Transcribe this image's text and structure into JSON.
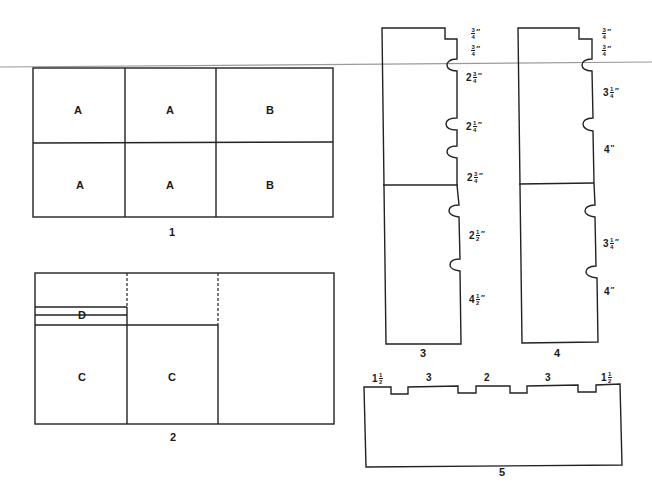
{
  "figure": {
    "diagram1": {
      "caption": "1",
      "cells": [
        {
          "row": 1,
          "col": 1,
          "label": "A"
        },
        {
          "row": 1,
          "col": 2,
          "label": "A"
        },
        {
          "row": 1,
          "col": 3,
          "label": "B"
        },
        {
          "row": 2,
          "col": 1,
          "label": "A"
        },
        {
          "row": 2,
          "col": 2,
          "label": "A"
        },
        {
          "row": 2,
          "col": 3,
          "label": "B"
        }
      ]
    },
    "diagram2": {
      "caption": "2",
      "labels": {
        "d": "D",
        "c1": "C",
        "c2": "C"
      }
    },
    "diagram3": {
      "caption": "3",
      "dimensions": [
        {
          "whole": "",
          "num": "3",
          "den": "4",
          "unit": "″"
        },
        {
          "whole": "",
          "num": "3",
          "den": "4",
          "unit": "″"
        },
        {
          "whole": "2",
          "num": "3",
          "den": "4",
          "unit": "″"
        },
        {
          "whole": "2",
          "num": "1",
          "den": "4",
          "unit": "″"
        },
        {
          "whole": "2",
          "num": "3",
          "den": "4",
          "unit": "″"
        },
        {
          "whole": "2",
          "num": "1",
          "den": "2",
          "unit": "″"
        },
        {
          "whole": "4",
          "num": "1",
          "den": "2",
          "unit": "″"
        }
      ]
    },
    "diagram4": {
      "caption": "4",
      "dimensions": [
        {
          "whole": "",
          "num": "3",
          "den": "4",
          "unit": "″"
        },
        {
          "whole": "",
          "num": "3",
          "den": "4",
          "unit": "″"
        },
        {
          "whole": "3",
          "num": "1",
          "den": "4",
          "unit": "″"
        },
        {
          "whole": "4",
          "num": "",
          "den": "",
          "unit": "″"
        },
        {
          "whole": "3",
          "num": "1",
          "den": "4",
          "unit": "″"
        },
        {
          "whole": "4",
          "num": "",
          "den": "",
          "unit": "″"
        }
      ]
    },
    "diagram5": {
      "caption": "5",
      "top_dimensions": [
        {
          "whole": "1",
          "num": "1",
          "den": "2"
        },
        {
          "whole": "3",
          "num": "",
          "den": ""
        },
        {
          "whole": "2",
          "num": "",
          "den": ""
        },
        {
          "whole": "3",
          "num": "",
          "den": ""
        },
        {
          "whole": "1",
          "num": "1",
          "den": "2"
        }
      ]
    }
  }
}
